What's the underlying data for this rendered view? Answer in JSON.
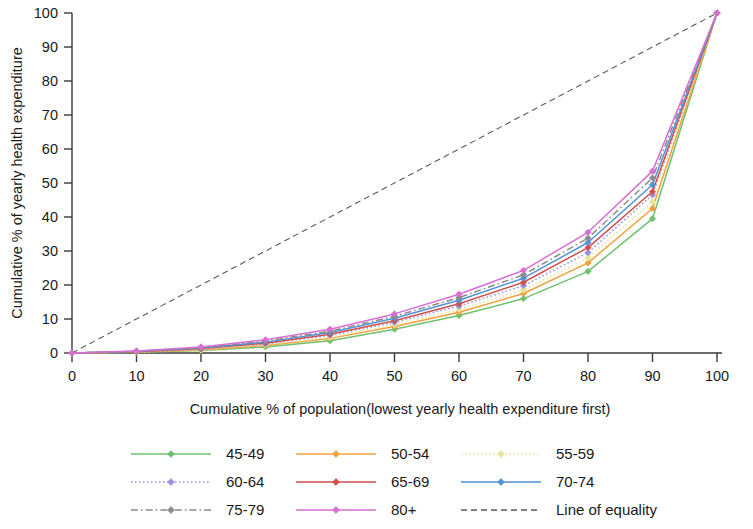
{
  "chart_data": {
    "type": "line",
    "title": "",
    "subtitle": "",
    "xlabel": "Cumulative % of population(lowest yearly health expenditure first)",
    "ylabel": "Cumulative % of yearly health expenditure",
    "xlim": [
      0,
      100
    ],
    "ylim": [
      0,
      100
    ],
    "xticks": [
      "0",
      "10",
      "20",
      "30",
      "40",
      "50",
      "60",
      "70",
      "80",
      "90",
      "100"
    ],
    "yticks": [
      "0",
      "10",
      "20",
      "30",
      "40",
      "50",
      "60",
      "70",
      "80",
      "90",
      "100"
    ],
    "grid": false,
    "legend_position": "bottom",
    "x": [
      0,
      10,
      20,
      30,
      40,
      50,
      60,
      70,
      80,
      90,
      100
    ],
    "series": [
      {
        "name": "45-49",
        "color": "#6fc06f",
        "marker": "diamond",
        "dash": "none",
        "values": [
          0,
          0.2,
          0.7,
          1.8,
          3.6,
          7.0,
          11.0,
          16.0,
          24.0,
          39.5,
          100
        ]
      },
      {
        "name": "50-54",
        "color": "#f2a03c",
        "marker": "diamond",
        "dash": "none",
        "values": [
          0,
          0.3,
          0.9,
          2.2,
          4.3,
          7.8,
          12.0,
          17.5,
          26.5,
          42.5,
          100
        ]
      },
      {
        "name": "55-59",
        "color": "#e8e49a",
        "marker": "diamond",
        "dash": "dotted",
        "values": [
          0,
          0.3,
          1.0,
          2.4,
          4.6,
          8.3,
          12.8,
          18.5,
          28.0,
          44.5,
          100
        ]
      },
      {
        "name": "60-64",
        "color": "#9a92e0",
        "marker": "diamond",
        "dash": "dotted",
        "values": [
          0,
          0.4,
          1.2,
          2.7,
          5.2,
          9.0,
          13.8,
          19.8,
          29.5,
          46.5,
          100
        ]
      },
      {
        "name": "65-69",
        "color": "#d0504e",
        "marker": "diamond",
        "dash": "none",
        "values": [
          0,
          0.4,
          1.3,
          2.9,
          5.5,
          9.5,
          14.5,
          20.8,
          31.0,
          47.5,
          100
        ]
      },
      {
        "name": "70-74",
        "color": "#4f93d6",
        "marker": "diamond",
        "dash": "none",
        "values": [
          0,
          0.5,
          1.5,
          3.2,
          6.0,
          10.2,
          15.5,
          22.0,
          32.5,
          49.5,
          100
        ]
      },
      {
        "name": "75-79",
        "color": "#8c8c8c",
        "marker": "diamond",
        "dash": "dashdot",
        "values": [
          0,
          0.5,
          1.6,
          3.5,
          6.4,
          10.8,
          16.3,
          23.0,
          33.8,
          51.5,
          100
        ]
      },
      {
        "name": "80+",
        "color": "#d96fd2",
        "marker": "diamond",
        "dash": "none",
        "values": [
          0,
          0.6,
          1.8,
          3.9,
          7.0,
          11.5,
          17.3,
          24.3,
          35.5,
          53.5,
          100
        ]
      }
    ],
    "reference_line": {
      "name": "Line of equality",
      "color": "#5a5a5a",
      "dash": "dashed",
      "points": [
        [
          0,
          0
        ],
        [
          100,
          100
        ]
      ]
    }
  },
  "legend": {
    "items": [
      {
        "label": "45-49",
        "color": "#6fc06f",
        "dash": "none"
      },
      {
        "label": "50-54",
        "color": "#f2a03c",
        "dash": "none"
      },
      {
        "label": "55-59",
        "color": "#e8e49a",
        "dash": "dotted"
      },
      {
        "label": "60-64",
        "color": "#9a92e0",
        "dash": "dotted"
      },
      {
        "label": "65-69",
        "color": "#d0504e",
        "dash": "none"
      },
      {
        "label": "70-74",
        "color": "#4f93d6",
        "dash": "none"
      },
      {
        "label": "75-79",
        "color": "#8c8c8c",
        "dash": "dashdot"
      },
      {
        "label": "80+",
        "color": "#d96fd2",
        "dash": "none"
      },
      {
        "label": "Line of equality",
        "color": "#5a5a5a",
        "dash": "dashed"
      }
    ]
  }
}
